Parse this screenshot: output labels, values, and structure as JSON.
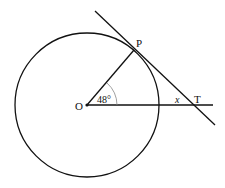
{
  "diagram": {
    "labels": {
      "center": "O",
      "tangent_point": "P",
      "external_point": "T",
      "angle_value": "48°",
      "unknown_angle": "x"
    },
    "colors": {
      "stroke": "#111111",
      "arc": "#888888"
    }
  }
}
